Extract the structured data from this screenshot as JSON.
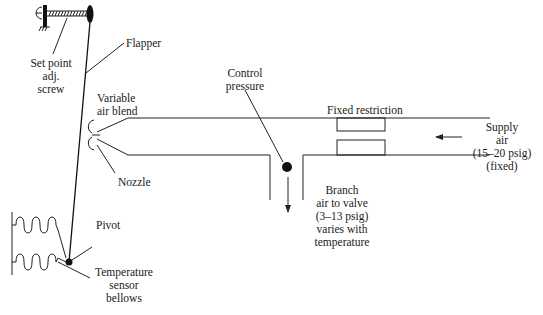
{
  "diagram": {
    "labels": {
      "flapper": "Flapper",
      "set_point_1": "Set point",
      "set_point_2": "adj.",
      "set_point_3": "screw",
      "variable_air_1": "Variable",
      "variable_air_2": "air blend",
      "nozzle": "Nozzle",
      "control_pressure_1": "Control",
      "control_pressure_2": "pressure",
      "fixed_restriction": "Fixed restriction",
      "supply_1": "Supply",
      "supply_2": "air",
      "supply_3": "(15–20 psig)",
      "supply_4": "(fixed)",
      "branch_1": "Branch",
      "branch_2": "air to valve",
      "branch_3": "(3–13 psig)",
      "branch_4": "varies with",
      "branch_5": "temperature",
      "pivot": "Pivot",
      "bellows_1": "Temperature",
      "bellows_2": "sensor",
      "bellows_3": "bellows"
    },
    "components": [
      {
        "name": "set-point-adjustment-screw",
        "icon": "screw-icon"
      },
      {
        "name": "flapper",
        "icon": "lever-line"
      },
      {
        "name": "nozzle",
        "icon": "nozzle-icon"
      },
      {
        "name": "control-pressure-point",
        "icon": "dot-icon"
      },
      {
        "name": "fixed-restriction",
        "icon": "orifice-icon"
      },
      {
        "name": "supply-air-arrow",
        "icon": "arrow-left-icon"
      },
      {
        "name": "branch-air-arrow",
        "icon": "arrow-down-icon"
      },
      {
        "name": "pivot",
        "icon": "dot-icon"
      },
      {
        "name": "temperature-sensor-bellows",
        "icon": "bellows-icon"
      }
    ],
    "colors": {
      "ink": "#222222",
      "background": "#ffffff"
    }
  }
}
